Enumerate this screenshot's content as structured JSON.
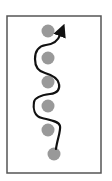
{
  "diagram": {
    "type": "winding-path-between-nodes",
    "frame": {
      "x": 7,
      "y": 16,
      "width": 94,
      "height": 157,
      "stroke": "#555555",
      "stroke_width": 1.5
    },
    "node_color": "#999999",
    "node_radius": 6.5,
    "nodes": [
      {
        "id": "node-1",
        "cx": 48,
        "cy": 31
      },
      {
        "id": "node-2",
        "cx": 48,
        "cy": 58
      },
      {
        "id": "node-3",
        "cx": 48,
        "cy": 82
      },
      {
        "id": "node-4",
        "cx": 48,
        "cy": 106
      },
      {
        "id": "node-5",
        "cx": 48,
        "cy": 130
      },
      {
        "id": "node-6",
        "cx": 54,
        "cy": 154
      }
    ],
    "path": {
      "color": "#111111",
      "stroke_width": 2.2,
      "d": "M 56 149 C 57 140, 61 131, 60 126 C 59 121, 50 120, 42 118 C 34 116, 33 108, 34 102 C 35 97, 42 95, 50 94 C 58 93, 60 89, 59 84 C 58 78, 52 75, 45 73 C 37 71, 35 66, 35 59 C 35 50, 39 46, 46 45 C 54 44, 58 41, 60 35 L 62 30",
      "arrowhead": {
        "tip_x": 65,
        "tip_y": 27
      }
    }
  }
}
